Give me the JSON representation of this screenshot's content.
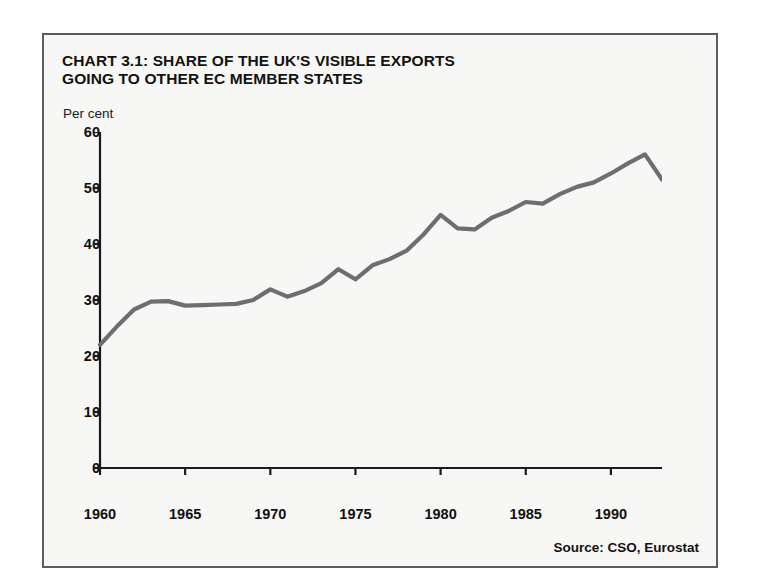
{
  "figure": {
    "title_line1": "CHART 3.1: SHARE OF THE UK'S VISIBLE EXPORTS",
    "title_line2": "GOING TO OTHER EC MEMBER STATES",
    "unit_label": "Per cent",
    "source": "Source: CSO, Eurostat",
    "line_color": "#6e6e6e",
    "axis_color": "#1a1a1a",
    "frame_color": "#5c5c5c",
    "background_color": "#f7f7f5"
  },
  "chart_data": {
    "type": "line",
    "title": "CHART 3.1: SHARE OF THE UK'S VISIBLE EXPORTS GOING TO OTHER EC MEMBER STATES",
    "xlabel": "",
    "ylabel": "Per cent",
    "xlim": [
      1960,
      1993
    ],
    "ylim": [
      0,
      60
    ],
    "yticks": [
      0,
      10,
      20,
      30,
      40,
      50,
      60
    ],
    "xticks": [
      1960,
      1965,
      1970,
      1975,
      1980,
      1985,
      1990
    ],
    "grid": false,
    "legend": false,
    "source": "Source: CSO, Eurostat",
    "series": [
      {
        "name": "Share of UK visible exports going to other EC member states",
        "x": [
          1960,
          1961,
          1962,
          1963,
          1964,
          1965,
          1966,
          1967,
          1968,
          1969,
          1970,
          1971,
          1972,
          1973,
          1974,
          1975,
          1976,
          1977,
          1978,
          1979,
          1980,
          1981,
          1982,
          1983,
          1984,
          1985,
          1986,
          1987,
          1988,
          1989,
          1990,
          1991,
          1992,
          1993
        ],
        "values": [
          22.0,
          25.3,
          28.3,
          29.7,
          29.8,
          29.0,
          29.1,
          29.2,
          29.3,
          30.0,
          31.9,
          30.6,
          31.6,
          33.0,
          35.5,
          33.7,
          36.2,
          37.3,
          38.8,
          41.7,
          45.2,
          42.8,
          42.6,
          44.7,
          45.9,
          47.5,
          47.2,
          48.9,
          50.2,
          51.0,
          52.6,
          54.4,
          56.0,
          51.5
        ]
      }
    ]
  }
}
